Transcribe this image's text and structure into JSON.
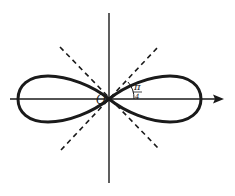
{
  "figure": {
    "curve": "lemniscate",
    "origin_label": "O",
    "angle_label_numerator": "π",
    "angle_label_denominator": "4",
    "asymptote_angle": "π/4",
    "colors": {
      "ink": "#1a1a1a",
      "background": "#ffffff"
    }
  }
}
